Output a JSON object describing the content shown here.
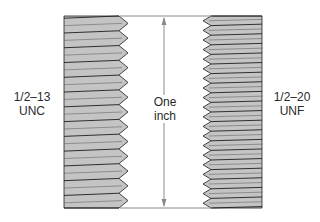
{
  "diagram": {
    "colors": {
      "thread_fill": "#c4c4c4",
      "thread_line": "#1e1e1e",
      "dimension_line": "#8a8a8a",
      "text": "#2a2a2a"
    },
    "left_thread": {
      "size": "1/2–13",
      "series": "UNC",
      "threads_per_inch": 13
    },
    "right_thread": {
      "size": "1/2–20",
      "series": "UNF",
      "threads_per_inch": 20
    },
    "dimension": {
      "line1": "One",
      "line2": "inch"
    }
  }
}
